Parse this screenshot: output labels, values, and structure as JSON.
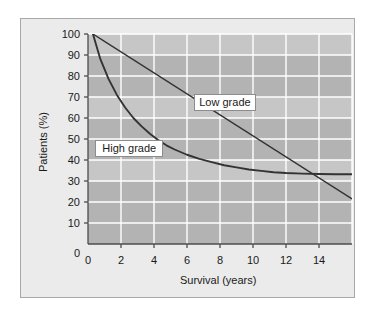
{
  "figure": {
    "panel_bg": "#ebebeb",
    "panel_border": "#a8a8a8",
    "plot_bg": "#b3b3b3",
    "plot_band": "#c6c6c6",
    "grid_color": "#ffffff",
    "axis_color": "#4d4d4d",
    "curve_color": "#333333"
  },
  "chart_data": {
    "type": "line",
    "title": "",
    "xlabel": "Survival (years)",
    "ylabel": "Patients (%)",
    "xlim": [
      0,
      16
    ],
    "ylim": [
      0,
      100
    ],
    "xticks": [
      0,
      2,
      4,
      6,
      8,
      10,
      12,
      14
    ],
    "xtick_labels": [
      "0",
      "2",
      "4",
      "6",
      "8",
      "10",
      "12",
      "14"
    ],
    "yticks": [
      0,
      10,
      20,
      30,
      40,
      50,
      60,
      70,
      80,
      90,
      100
    ],
    "ytick_labels": [
      "0",
      "10",
      "20",
      "30",
      "40",
      "50",
      "60",
      "70",
      "80",
      "90",
      "100"
    ],
    "grid": true,
    "legend": "inline-callout-boxes",
    "series": [
      {
        "name": "Low grade",
        "x": [
          0.3,
          1,
          2,
          3,
          4,
          5,
          6,
          7,
          8,
          9,
          10,
          11,
          12,
          13,
          14,
          15,
          16
        ],
        "values": [
          100,
          96.5,
          91.5,
          86.5,
          81.5,
          76.5,
          71.5,
          66.5,
          61.5,
          56.5,
          51.5,
          46.5,
          41.5,
          36.5,
          31.5,
          26.5,
          21.5
        ]
      },
      {
        "name": "High grade",
        "x": [
          0.3,
          0.75,
          1.25,
          1.75,
          2.25,
          2.75,
          3.25,
          3.75,
          4.25,
          4.75,
          5.25,
          6,
          6.75,
          7.5,
          8.25,
          9,
          9.75,
          10.5,
          11.25,
          12,
          13,
          14,
          15,
          16
        ],
        "values": [
          100,
          88,
          78.5,
          71,
          65,
          60,
          56,
          52.5,
          49.5,
          47,
          45,
          42.5,
          40.5,
          39,
          37.5,
          36.5,
          35.5,
          34.8,
          34.2,
          33.8,
          33.5,
          33.3,
          33.2,
          33.2
        ]
      }
    ],
    "annotations": [
      {
        "text": "Low grade",
        "x": 8.3,
        "y": 67.5
      },
      {
        "text": "High grade",
        "x": 2.5,
        "y": 45.5
      }
    ]
  }
}
